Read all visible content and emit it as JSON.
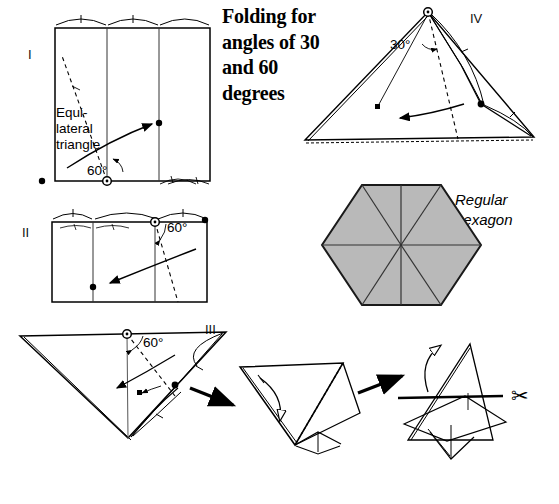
{
  "document": {
    "title_lines": [
      "Folding for",
      "angles of 30",
      "and 60",
      "degrees"
    ],
    "type": "paper-folding instruction diagram"
  },
  "steps": [
    {
      "id": "I",
      "label": "I",
      "annotations": [
        "Equi-",
        "lateral",
        "triangle",
        "60°"
      ],
      "angle": "60°",
      "note_lines": [
        "Equi-",
        "lateral",
        "triangle"
      ]
    },
    {
      "id": "II",
      "label": "II",
      "angle": "60°"
    },
    {
      "id": "III",
      "label": "III",
      "angle": "60°"
    },
    {
      "id": "IV",
      "label": "IV",
      "angle": "30°"
    }
  ],
  "hexagon": {
    "caption_lines": [
      "Regular",
      "hexagon"
    ],
    "fill_color": "#b9b9b9",
    "stroke_color": "#1a1a1a",
    "sectors": 6
  },
  "icons": {
    "scissors": "✂",
    "scissors_name": "scissors-icon"
  },
  "colors": {
    "ink": "#000000",
    "paper": "#ffffff",
    "hexagon_gray": "#b9b9b9"
  }
}
